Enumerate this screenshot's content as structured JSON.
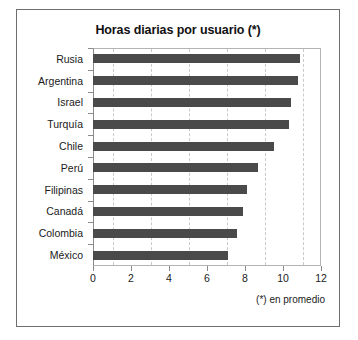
{
  "figure": {
    "title": "Horas diarias por usuario (*)",
    "footnote": "(*) en promedio",
    "bar_color": "#4a4a4a",
    "grid_color": "#c9c9c9",
    "frame_color": "#6e6e6e"
  },
  "chart_data": {
    "type": "bar",
    "orientation": "horizontal",
    "title": "Horas diarias por usuario (*)",
    "xlabel": "",
    "ylabel": "",
    "xlim": [
      0,
      12
    ],
    "xticks": [
      0,
      2,
      4,
      6,
      8,
      10,
      12
    ],
    "tick_labels": [
      "0",
      "2",
      "4",
      "6",
      "8",
      "10",
      "12"
    ],
    "grid": "vertical-dashed",
    "legend": "none",
    "annotations": [
      "(*) en promedio"
    ],
    "categories": [
      "Rusia",
      "Argentina",
      "Israel",
      "Turquía",
      "Chile",
      "Perú",
      "Filipinas",
      "Canadá",
      "Colombia",
      "México"
    ],
    "values": [
      10.9,
      10.8,
      10.4,
      10.3,
      9.5,
      8.7,
      8.1,
      7.9,
      7.6,
      7.1
    ]
  }
}
